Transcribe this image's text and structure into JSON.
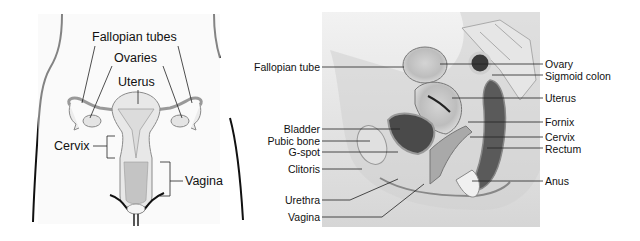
{
  "frontal_view": {
    "labels": {
      "fallopian_tubes": "Fallopian tubes",
      "ovaries": "Ovaries",
      "uterus": "Uterus",
      "cervix": "Cervix",
      "vagina": "Vagina"
    }
  },
  "sagittal_view": {
    "left_labels": {
      "fallopian_tube": "Fallopian tube",
      "bladder": "Bladder",
      "pubic_bone": "Pubic bone",
      "g_spot": "G-spot",
      "clitoris": "Clitoris",
      "urethra": "Urethra",
      "vagina": "Vagina"
    },
    "right_labels": {
      "ovary": "Ovary",
      "sigmoid_colon": "Sigmoid colon",
      "uterus": "Uterus",
      "fornix": "Fornix",
      "cervix": "Cervix",
      "rectum": "Rectum",
      "anus": "Anus"
    }
  },
  "colors": {
    "outline": "#111111",
    "organ_fill": "#e6e6e6",
    "organ_stroke": "#8a8a8a",
    "vagina_fill": "#c8c8c8",
    "illustration_bg": "#dcdcdc"
  }
}
